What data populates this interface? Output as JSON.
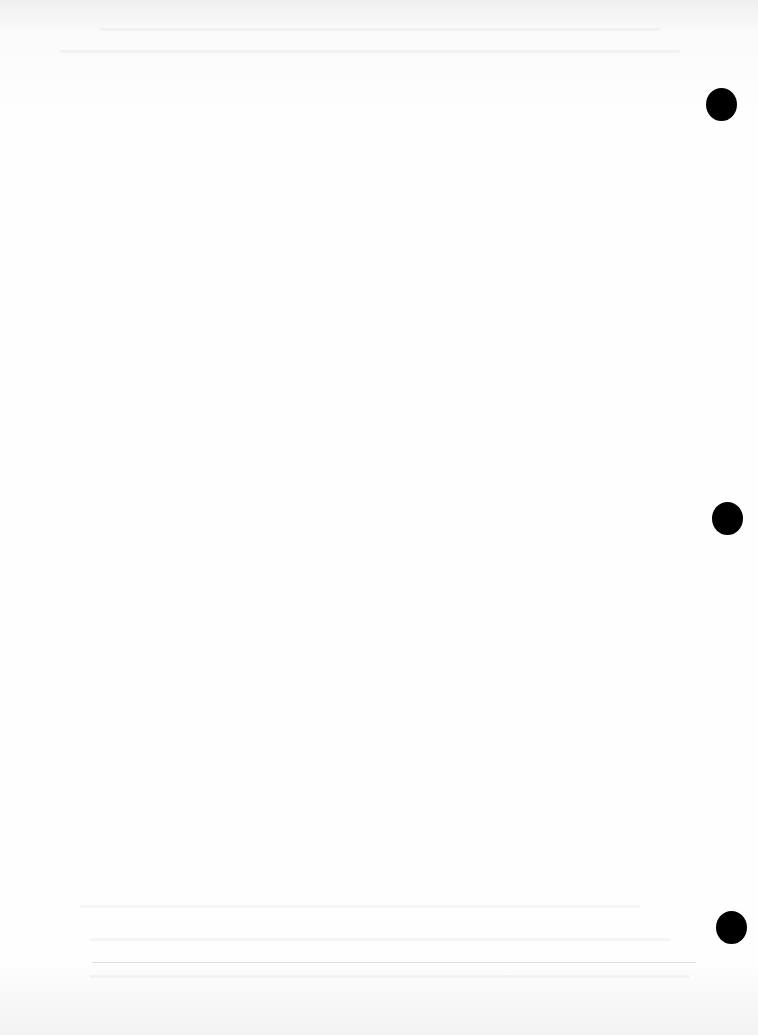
{
  "document": {
    "type": "scanned blank page",
    "text": "",
    "punch_holes": [
      {
        "x": 722,
        "y": 104
      },
      {
        "x": 727,
        "y": 518
      },
      {
        "x": 731,
        "y": 927
      }
    ],
    "colors": {
      "paper": "#fdfdfd",
      "hole": "#000000"
    }
  }
}
